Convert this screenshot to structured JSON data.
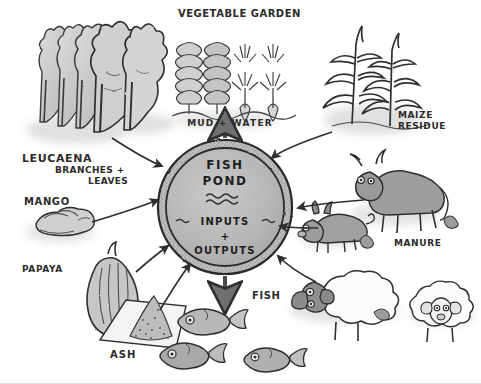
{
  "diagram": {
    "background_color": "#ffffff",
    "ink_color": "#2b2b2b"
  },
  "pond": {
    "line1": "FISH",
    "line2": "POND",
    "waves": "~~~",
    "inputs": "INPUTS",
    "plus": "+",
    "outputs": "OUTPUTS",
    "fill_color": "#b9b9b9",
    "rim_color": "#8d8d8d"
  },
  "labels": {
    "vegetable_garden": "VEGETABLE GARDEN",
    "mud_water": "MUD +      WATER",
    "maize_residue_line1": "MAIZE",
    "maize_residue_line2": "RESIDUE",
    "leucaena": "LEUCAENA",
    "branches": "BRANCHES +",
    "leaves": "LEAVES",
    "mango": "MANGO",
    "papaya": "PAPAYA",
    "ash": "ASH",
    "fish": "FISH",
    "manure": "MANURE"
  },
  "elements": [
    {
      "name": "leucaena-trees",
      "label": "LEUCAENA BRANCHES + LEAVES",
      "role": "input"
    },
    {
      "name": "vegetable-garden",
      "label": "VEGETABLE GARDEN",
      "role": "output"
    },
    {
      "name": "maize-plants",
      "label": "MAIZE RESIDUE",
      "role": "input"
    },
    {
      "name": "cow",
      "label": "MANURE",
      "role": "input"
    },
    {
      "name": "pig",
      "label": "MANURE",
      "role": "input"
    },
    {
      "name": "sheep",
      "label": "MANURE",
      "role": "input"
    },
    {
      "name": "mango-fruit",
      "label": "MANGO",
      "role": "input"
    },
    {
      "name": "papaya-fruit",
      "label": "PAPAYA",
      "role": "input"
    },
    {
      "name": "ash-mat",
      "label": "ASH",
      "role": "input"
    },
    {
      "name": "fish-harvest",
      "label": "FISH",
      "role": "output"
    }
  ]
}
